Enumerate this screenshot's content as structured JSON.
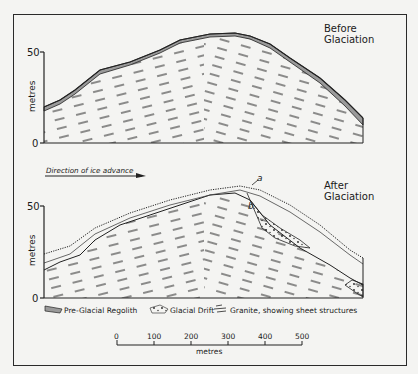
{
  "panels": {
    "top": {
      "title_line1": "Before",
      "title_line2": "Glaciation",
      "y_axis_label": "metres",
      "y_ticks": [
        "50",
        "0"
      ]
    },
    "bottom": {
      "title_line1": "After",
      "title_line2": "Glaciation",
      "y_axis_label": "metres",
      "y_ticks": [
        "50",
        "0"
      ],
      "direction_label": "Direction of ice advance",
      "label_a": "a",
      "label_b": "b"
    }
  },
  "legend": {
    "items": [
      {
        "icon": "regolith-swatch-icon",
        "label": "Pre-Glacial Regolith"
      },
      {
        "icon": "drift-swatch-icon",
        "label": "Glacial Drift"
      },
      {
        "icon": "granite-swatch-icon",
        "label": "Granite, showing sheet structures"
      }
    ]
  },
  "scale_bar": {
    "ticks": [
      "0",
      "100",
      "200",
      "300",
      "400",
      "500"
    ],
    "unit": "metres"
  },
  "colors": {
    "ink": "#1a1a1a",
    "paper": "#f4f4f2",
    "regolith": "#9a9a9a"
  }
}
